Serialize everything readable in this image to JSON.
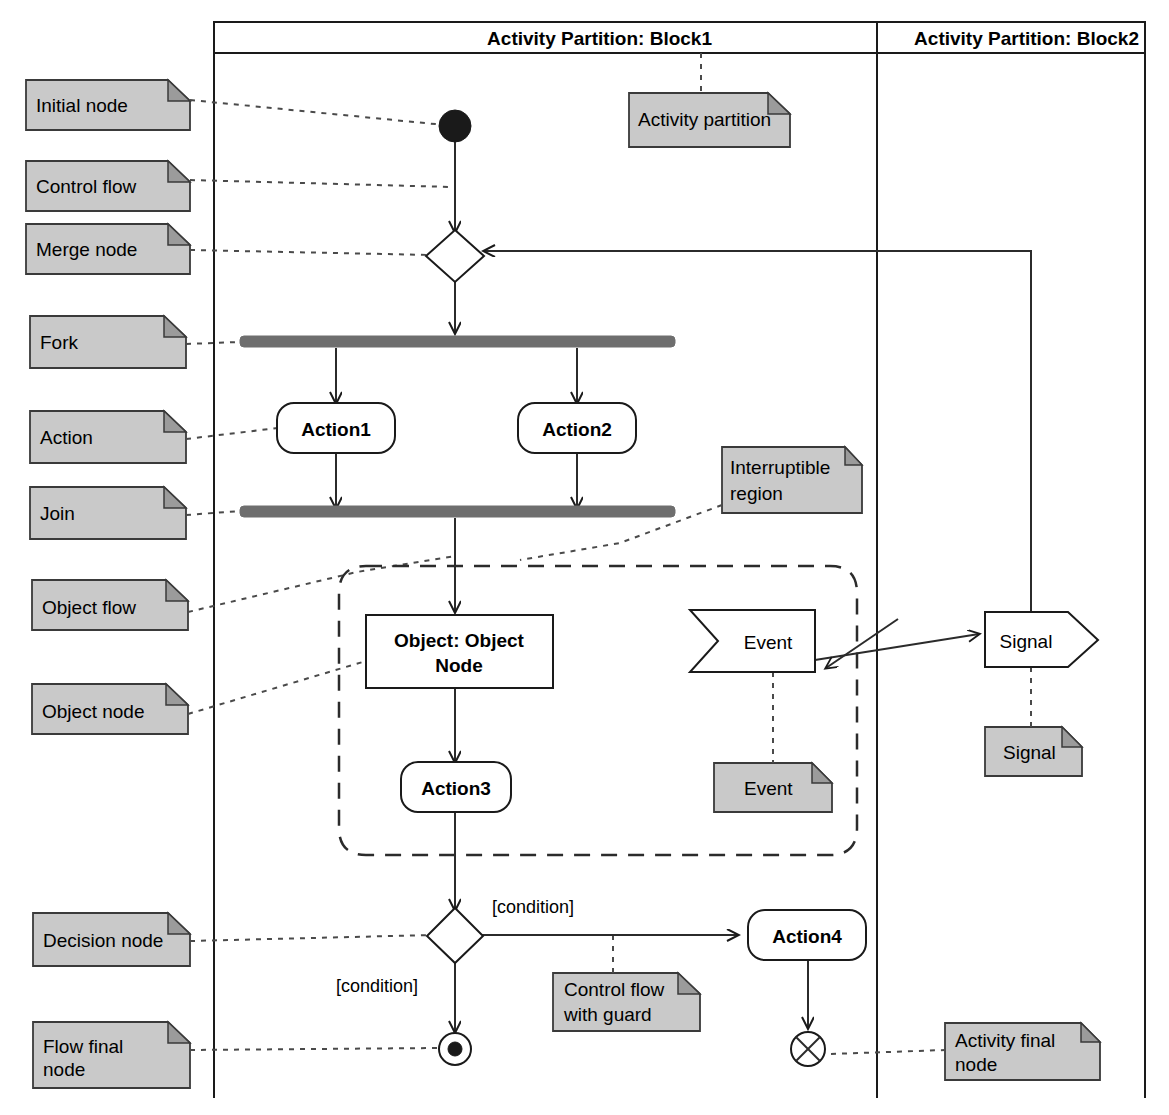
{
  "diagram": {
    "colors": {
      "note_fill": "#c9c9c9",
      "note_fold": "#9b9b9b",
      "bar_fill": "#6e6e6e",
      "line": "#1a1a1a",
      "background": "#ffffff"
    }
  },
  "partitions": [
    {
      "id": "block1",
      "title": "Activity Partition: Block1"
    },
    {
      "id": "block2",
      "title": "Activity Partition: Block2"
    }
  ],
  "left_notes": [
    {
      "id": "initial-node",
      "label": "Initial node"
    },
    {
      "id": "control-flow",
      "label": "Control flow"
    },
    {
      "id": "merge-node",
      "label": "Merge node"
    },
    {
      "id": "fork",
      "label": "Fork"
    },
    {
      "id": "action",
      "label": "Action"
    },
    {
      "id": "join",
      "label": "Join"
    },
    {
      "id": "object-flow",
      "label": "Object flow"
    },
    {
      "id": "object-node",
      "label": "Object node"
    },
    {
      "id": "decision-node",
      "label": "Decision node"
    },
    {
      "id": "flow-final-node",
      "label": "Flow final node",
      "lines": [
        "Flow final",
        "node"
      ]
    }
  ],
  "inline_notes": [
    {
      "id": "activity-partition",
      "label": "Activity partition",
      "lines": [
        "Activity partition"
      ]
    },
    {
      "id": "interruptible-region",
      "label": "Interruptible region",
      "lines": [
        "Interruptible",
        "region"
      ]
    },
    {
      "id": "event",
      "label": "Event",
      "lines": [
        "Event"
      ]
    },
    {
      "id": "signal",
      "label": "Signal",
      "lines": [
        "Signal"
      ]
    },
    {
      "id": "control-flow-with-guard",
      "label": "Control flow with guard",
      "lines": [
        "Control flow",
        "with guard"
      ]
    },
    {
      "id": "activity-final-node",
      "label": "Activity final node",
      "lines": [
        "Activity final",
        "node"
      ]
    }
  ],
  "nodes": [
    {
      "id": "action1",
      "type": "action",
      "label": "Action1"
    },
    {
      "id": "action2",
      "type": "action",
      "label": "Action2"
    },
    {
      "id": "action3",
      "type": "action",
      "label": "Action3"
    },
    {
      "id": "action4",
      "type": "action",
      "label": "Action4"
    },
    {
      "id": "object-node",
      "type": "object",
      "label": "Object: Object Node",
      "lines": [
        "Object: Object",
        "Node"
      ]
    },
    {
      "id": "event-node",
      "type": "accept-event",
      "label": "Event"
    },
    {
      "id": "signal-node",
      "type": "send-signal",
      "label": "Signal"
    },
    {
      "id": "initial",
      "type": "initial-node",
      "label": ""
    },
    {
      "id": "merge",
      "type": "merge-node",
      "label": ""
    },
    {
      "id": "fork-bar",
      "type": "fork",
      "label": ""
    },
    {
      "id": "join-bar",
      "type": "join",
      "label": ""
    },
    {
      "id": "decision",
      "type": "decision-node",
      "label": ""
    },
    {
      "id": "flow-final",
      "type": "flow-final-node",
      "label": ""
    },
    {
      "id": "activity-final",
      "type": "activity-final-node",
      "label": ""
    }
  ],
  "edge_labels": [
    {
      "id": "guard-right",
      "text": "[condition]"
    },
    {
      "id": "guard-down",
      "text": "[condition]"
    }
  ]
}
